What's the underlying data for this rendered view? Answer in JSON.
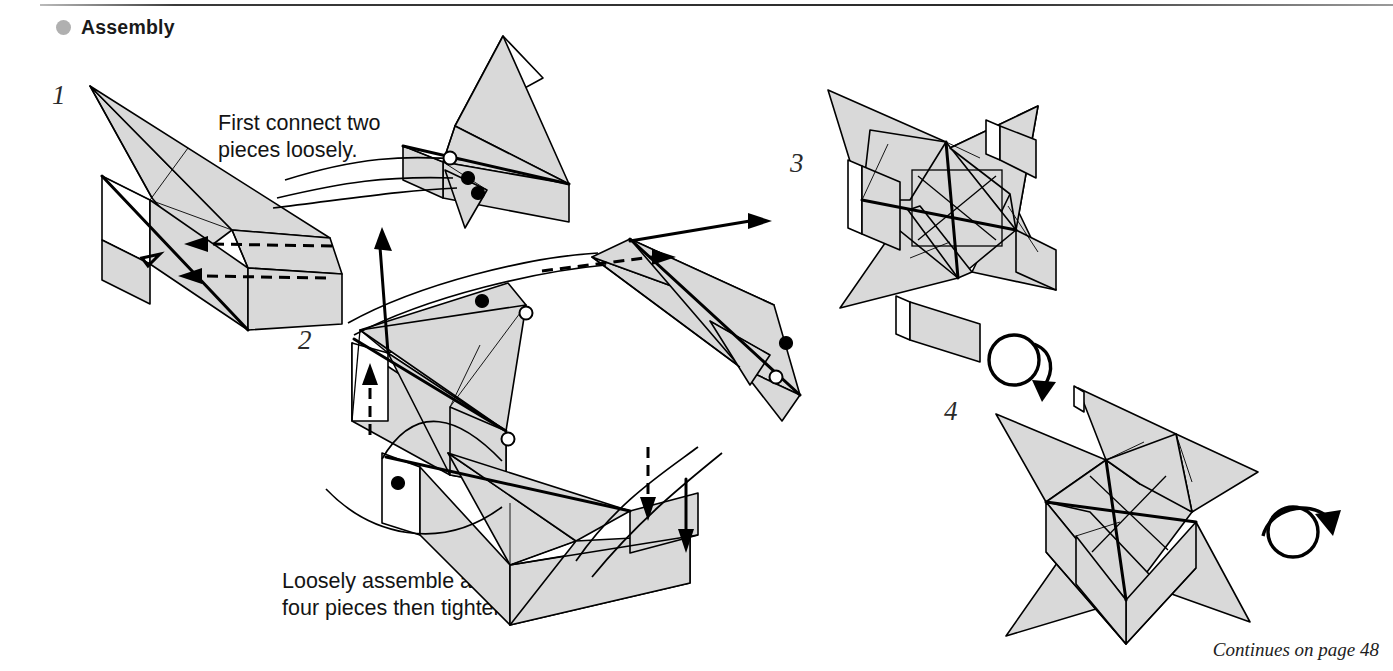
{
  "page": {
    "section_bullet_color": "#b0b0b0",
    "paper_fill_color": "#d9d9d9",
    "line_color": "#000000",
    "background_color": "#ffffff"
  },
  "header": {
    "bullet_icon": "filled-circle-bullet",
    "title": "Assembly"
  },
  "steps": [
    {
      "number": "1",
      "caption": "First connect two\npieces loosely.",
      "caption_line1": "First connect two",
      "caption_line2": "pieces loosely.",
      "markers": {
        "white_circles": 1,
        "black_dots": 2
      },
      "motion_arrows": [
        {
          "type": "dashed-arrow",
          "direction": "left"
        },
        {
          "type": "dashed-arrow",
          "direction": "left"
        }
      ]
    },
    {
      "number": "2",
      "caption": "Loosely assemble all\nfour pieces then tighten.",
      "caption_line1": "Loosely assemble all",
      "caption_line2": "four pieces then tighten.",
      "markers": {
        "white_circles": 3,
        "black_dots": 3
      },
      "motion_arrows": [
        {
          "type": "solid-arrow",
          "direction": "up-left"
        },
        {
          "type": "dashed-arrow",
          "direction": "up"
        },
        {
          "type": "dashed-arrow",
          "direction": "right"
        },
        {
          "type": "solid-arrow",
          "direction": "up-right"
        },
        {
          "type": "dashed-arrow",
          "direction": "down"
        },
        {
          "type": "solid-arrow",
          "direction": "down"
        }
      ]
    },
    {
      "number": "3",
      "caption": "",
      "markers": {
        "white_circles": 0,
        "black_dots": 0
      },
      "motion_arrows": []
    },
    {
      "number": "4",
      "caption": "",
      "markers": {
        "white_circles": 0,
        "black_dots": 0
      },
      "motion_arrows": []
    }
  ],
  "rotation_arrows": [
    {
      "name": "turn-over-arrow-1",
      "icon": "rotate-circle-arrow",
      "direction": "down-right"
    },
    {
      "name": "turn-over-arrow-2",
      "icon": "rotate-circle-arrow",
      "direction": "down-right"
    }
  ],
  "footer": {
    "note": "Continues on page 48"
  }
}
